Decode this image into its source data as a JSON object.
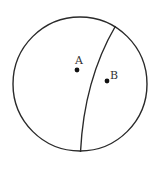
{
  "diagram": {
    "circle": {
      "cx": 80,
      "cy": 84,
      "r": 67,
      "stroke": "#2a2a2a"
    },
    "curve": {
      "path": "M 115.5 26 Q 84 80 80.5 152",
      "stroke": "#2a2a2a"
    },
    "points": [
      {
        "label": "A",
        "x": 77,
        "y": 70,
        "label_x": 75,
        "label_y": 55
      },
      {
        "label": "B",
        "x": 107,
        "y": 81,
        "label_x": 110,
        "label_y": 70
      }
    ]
  }
}
